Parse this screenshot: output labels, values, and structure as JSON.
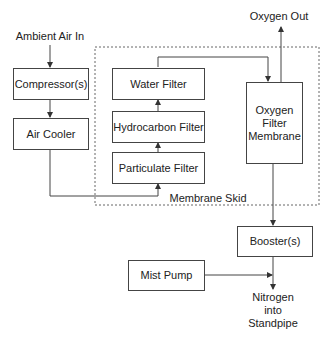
{
  "diagram": {
    "type": "process-flow",
    "inputs": {
      "ambient_air": "Ambient Air In"
    },
    "outputs": {
      "oxygen": "Oxygen Out",
      "nitrogen": [
        "Nitrogen",
        "into",
        "Standpipe"
      ]
    },
    "nodes": {
      "compressor": "Compressor(s)",
      "air_cooler": "Air Cooler",
      "water_filter": "Water Filter",
      "hydrocarbon_filter": "Hydrocarbon Filter",
      "particulate_filter": "Particulate Filter",
      "oxygen_membrane": [
        "Oxygen",
        "Filter",
        "Membrane"
      ],
      "booster": "Booster(s)",
      "mist_pump": "Mist Pump"
    },
    "group": {
      "membrane_skid": "Membrane Skid"
    },
    "edges": [
      [
        "Ambient Air In",
        "Compressor(s)"
      ],
      [
        "Compressor(s)",
        "Air Cooler"
      ],
      [
        "Air Cooler",
        "Particulate Filter"
      ],
      [
        "Particulate Filter",
        "Hydrocarbon Filter"
      ],
      [
        "Hydrocarbon Filter",
        "Water Filter"
      ],
      [
        "Water Filter",
        "Oxygen Filter Membrane"
      ],
      [
        "Oxygen Filter Membrane",
        "Oxygen Out"
      ],
      [
        "Oxygen Filter Membrane",
        "Booster(s)"
      ],
      [
        "Booster(s)",
        "Nitrogen into Standpipe"
      ],
      [
        "Mist Pump",
        "Nitrogen into Standpipe"
      ]
    ],
    "colors": {
      "line": "#444444",
      "text": "#222222",
      "background": "#ffffff"
    }
  }
}
